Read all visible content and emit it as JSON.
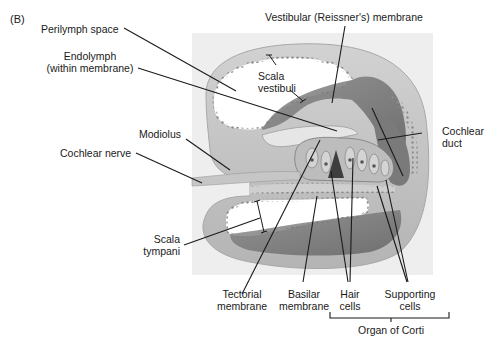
{
  "figure": {
    "panel_label": "(B)",
    "labels": {
      "perilymph_space": "Perilymph space",
      "endolymph_line1": "Endolymph",
      "endolymph_line2": "(within membrane)",
      "vestibular_membrane": "Vestibular (Reissner's) membrane",
      "scala_vestibuli_line1": "Scala",
      "scala_vestibuli_line2": "vestibuli",
      "modiolus": "Modiolus",
      "cochlear_nerve": "Cochlear nerve",
      "cochlear_duct_line1": "Cochlear",
      "cochlear_duct_line2": "duct",
      "scala_tympani_line1": "Scala",
      "scala_tympani_line2": "tympani",
      "tectorial_line1": "Tectorial",
      "tectorial_line2": "membrane",
      "basilar_line1": "Basilar",
      "basilar_line2": "membrane",
      "hair_line1": "Hair",
      "hair_line2": "cells",
      "supporting_line1": "Supporting",
      "supporting_line2": "cells",
      "organ_of_corti": "Organ of Corti"
    },
    "colors": {
      "panel_bg": "#eeeeee",
      "tissue_light": "#c8c8c8",
      "tissue_mid": "#9a9a9a",
      "tissue_dark": "#6e6e6e",
      "cavity": "#ffffff",
      "leader_line": "#1a1a1a"
    }
  }
}
